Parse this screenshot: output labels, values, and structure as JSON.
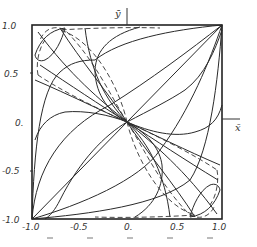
{
  "figure": {
    "x_axis": {
      "label": "x̄",
      "ticks": [
        "-1.0",
        "-0.5",
        "0.",
        "0.5",
        "1.0"
      ],
      "range": [
        -1.0,
        1.0
      ]
    },
    "y_axis": {
      "label": "ȳ",
      "ticks": [
        "1.0",
        "0.5",
        "0.",
        "-0.5",
        "-1.0"
      ],
      "range": [
        -1.0,
        1.0
      ]
    },
    "colors": {
      "line": "#2a2a2a",
      "background": "#ffffff"
    }
  }
}
